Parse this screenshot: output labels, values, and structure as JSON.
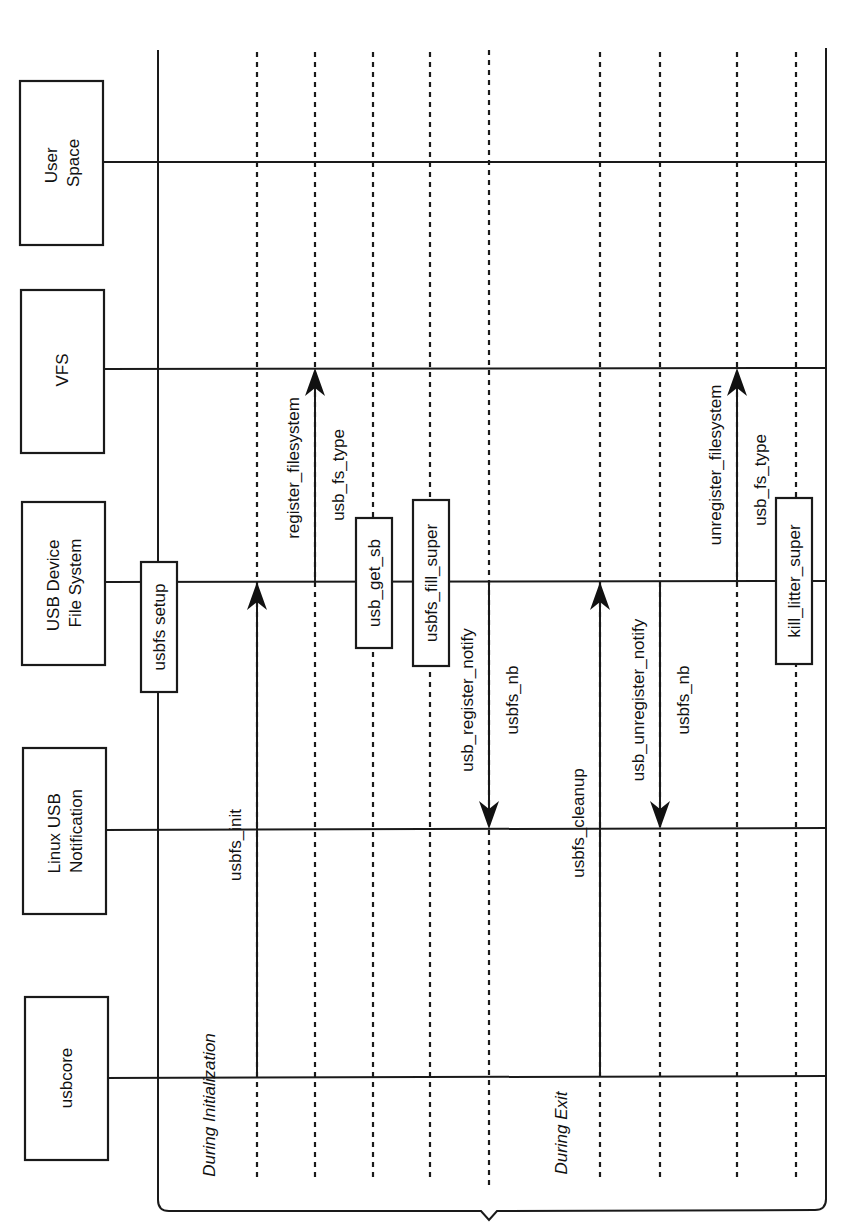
{
  "diagram": {
    "type": "sequence-diagram",
    "orientation": "rotated-90-ccw",
    "colors": {
      "line": "#1a1a1a",
      "text": "#111111",
      "background": "#ffffff"
    },
    "actors": [
      {
        "id": "user_space",
        "label_line1": "User",
        "label_line2": "Space"
      },
      {
        "id": "vfs",
        "label_line1": "VFS",
        "label_line2": ""
      },
      {
        "id": "usbfs",
        "label_line1": "USB Device",
        "label_line2": "File System"
      },
      {
        "id": "notif",
        "label_line1": "Linux USB",
        "label_line2": "Notification"
      },
      {
        "id": "usbcore",
        "label_line1": "usbcore",
        "label_line2": ""
      }
    ],
    "activations": [
      {
        "label": "usbfs setup",
        "on": "usbfs"
      },
      {
        "label": "usb_get_sb",
        "on": "usbfs"
      },
      {
        "label": "usbfs_fill_super",
        "on": "usbfs"
      },
      {
        "label": "kill_litter_super",
        "on": "usbfs"
      }
    ],
    "messages": [
      {
        "label": "usbfs_init",
        "sublabel": "",
        "from": "usbcore",
        "to": "usbfs"
      },
      {
        "label": "register_filesystem",
        "sublabel": "usb_fs_type",
        "from": "usbfs",
        "to": "vfs"
      },
      {
        "label": "usb_register_notify",
        "sublabel": "usbfs_nb",
        "from": "usbfs",
        "to": "notif"
      },
      {
        "label": "usbfs_cleanup",
        "sublabel": "",
        "from": "usbcore",
        "to": "usbfs"
      },
      {
        "label": "usb_unregister_notify",
        "sublabel": "usbfs_nb",
        "from": "usbfs",
        "to": "notif"
      },
      {
        "label": "unregister_filesystem",
        "sublabel": "usb_fs_type",
        "from": "usbfs",
        "to": "vfs"
      }
    ],
    "phases": [
      {
        "label": "During Initialization"
      },
      {
        "label": "During Exit"
      }
    ]
  }
}
